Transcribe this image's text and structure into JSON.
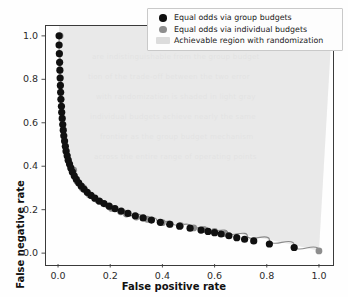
{
  "chart_data": {
    "type": "scatter",
    "title": "",
    "xlabel": "False positive rate",
    "ylabel": "False negative rate",
    "xlim": [
      -0.05,
      1.05
    ],
    "ylim": [
      -0.05,
      1.05
    ],
    "xticks": [
      "0.0",
      "0.2",
      "0.4",
      "0.6",
      "0.8",
      "1.0"
    ],
    "xtick_values": [
      0.0,
      0.2,
      0.4,
      0.6,
      0.8,
      1.0
    ],
    "yticks": [
      "0.0",
      "0.2",
      "0.4",
      "0.6",
      "0.8",
      "1.0"
    ],
    "ytick_values": [
      0.0,
      0.2,
      0.4,
      0.6,
      0.8,
      1.0
    ],
    "grid": false,
    "legend_position": "upper right",
    "colors": {
      "group_budgets": "#101010",
      "individual_budgets": "#8d8d8d",
      "achievable_region": "#dcdcdc",
      "frontier_line": "#8a8a8a",
      "axis": "#3a3a3a"
    },
    "series": [
      {
        "name": "Equal odds via group budgets",
        "marker": "circle",
        "color": "#101010",
        "points": [
          [
            0.004,
            1.0
          ],
          [
            0.004,
            0.958
          ],
          [
            0.005,
            0.918
          ],
          [
            0.006,
            0.878
          ],
          [
            0.007,
            0.842
          ],
          [
            0.008,
            0.806
          ],
          [
            0.009,
            0.772
          ],
          [
            0.01,
            0.74
          ],
          [
            0.011,
            0.708
          ],
          [
            0.013,
            0.676
          ],
          [
            0.014,
            0.648
          ],
          [
            0.016,
            0.62
          ],
          [
            0.018,
            0.592
          ],
          [
            0.02,
            0.566
          ],
          [
            0.022,
            0.54
          ],
          [
            0.025,
            0.516
          ],
          [
            0.028,
            0.492
          ],
          [
            0.031,
            0.47
          ],
          [
            0.035,
            0.448
          ],
          [
            0.039,
            0.428
          ],
          [
            0.044,
            0.41
          ],
          [
            0.049,
            0.392
          ],
          [
            0.055,
            0.374
          ],
          [
            0.062,
            0.356
          ],
          [
            0.07,
            0.34
          ],
          [
            0.079,
            0.324
          ],
          [
            0.089,
            0.308
          ],
          [
            0.1,
            0.294
          ],
          [
            0.112,
            0.28
          ],
          [
            0.126,
            0.266
          ],
          [
            0.141,
            0.253
          ],
          [
            0.158,
            0.24
          ],
          [
            0.176,
            0.228
          ],
          [
            0.196,
            0.216
          ],
          [
            0.218,
            0.205
          ],
          [
            0.242,
            0.194
          ],
          [
            0.268,
            0.183
          ],
          [
            0.296,
            0.172
          ],
          [
            0.326,
            0.162
          ],
          [
            0.358,
            0.152
          ],
          [
            0.392,
            0.142
          ],
          [
            0.428,
            0.133
          ],
          [
            0.466,
            0.124
          ],
          [
            0.506,
            0.115
          ],
          [
            0.548,
            0.106
          ],
          [
            0.575,
            0.1
          ],
          [
            0.6,
            0.094
          ],
          [
            0.625,
            0.088
          ],
          [
            0.655,
            0.08
          ],
          [
            0.685,
            0.071
          ],
          [
            0.715,
            0.064
          ],
          [
            0.75,
            0.056
          ],
          [
            0.81,
            0.042
          ],
          [
            0.905,
            0.026
          ]
        ]
      },
      {
        "name": "Equal odds via individual budgets",
        "marker": "circle",
        "color": "#8d8d8d",
        "points": [
          [
            0.008,
            1.0
          ],
          [
            0.03,
            0.468
          ],
          [
            0.06,
            0.382
          ],
          [
            0.098,
            0.3
          ],
          [
            0.128,
            0.264
          ],
          [
            0.16,
            0.238
          ],
          [
            0.205,
            0.206
          ],
          [
            0.24,
            0.19
          ],
          [
            0.262,
            0.18
          ],
          [
            0.3,
            0.166
          ],
          [
            0.342,
            0.156
          ],
          [
            0.4,
            0.14
          ],
          [
            0.43,
            0.132
          ],
          [
            0.47,
            0.126
          ],
          [
            0.52,
            0.116
          ],
          [
            0.56,
            0.108
          ],
          [
            0.6,
            0.1
          ],
          [
            0.64,
            0.09
          ],
          [
            1.0,
            0.01
          ]
        ]
      }
    ],
    "frontier_curve": [
      [
        0.004,
        1.0
      ],
      [
        0.01,
        0.7
      ],
      [
        0.018,
        0.56
      ],
      [
        0.028,
        0.47
      ],
      [
        0.042,
        0.4
      ],
      [
        0.06,
        0.348
      ],
      [
        0.082,
        0.308
      ],
      [
        0.108,
        0.276
      ],
      [
        0.14,
        0.248
      ],
      [
        0.178,
        0.224
      ],
      [
        0.22,
        0.203
      ],
      [
        0.268,
        0.184
      ],
      [
        0.32,
        0.167
      ],
      [
        0.378,
        0.152
      ],
      [
        0.44,
        0.138
      ],
      [
        0.506,
        0.124
      ],
      [
        0.575,
        0.111
      ],
      [
        0.648,
        0.097
      ],
      [
        0.725,
        0.081
      ],
      [
        0.81,
        0.062
      ],
      [
        0.905,
        0.037
      ],
      [
        1.0,
        0.01
      ]
    ],
    "legend": [
      {
        "label": "Equal odds via group budgets",
        "key": "dot",
        "color": "#101010"
      },
      {
        "label": "Equal odds via individual budgets",
        "key": "dot",
        "color": "#8d8d8d"
      },
      {
        "label": "Achievable region with randomization",
        "key": "patch",
        "color": "#dcdcdc"
      }
    ]
  },
  "background_text": [
    {
      "text": "are indistinguishable from the group budget",
      "x": 92,
      "y": 52
    },
    {
      "text": "tion of the trade-off between the two error",
      "x": 88,
      "y": 72
    },
    {
      "text": "with randomization is shaded in light gray",
      "x": 96,
      "y": 92
    },
    {
      "text": "individual budgets achieve nearly the same",
      "x": 90,
      "y": 112
    },
    {
      "text": "frontier as the group budget mechanism",
      "x": 100,
      "y": 132
    },
    {
      "text": "across the entire range of operating points",
      "x": 94,
      "y": 152
    }
  ]
}
